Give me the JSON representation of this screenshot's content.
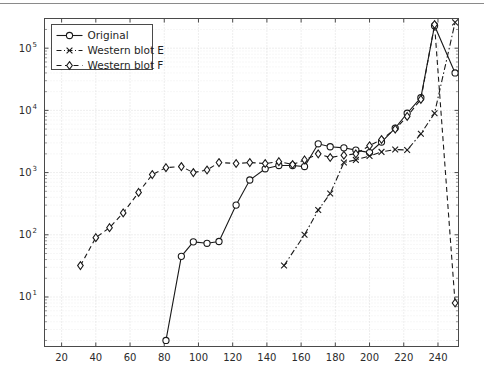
{
  "figure": {
    "top_rule": true,
    "background": "#ffffff",
    "ink_color": "#1a1a1a",
    "grid_color": "#cfcfcf",
    "axis_color": "#4a4a4a"
  },
  "legend": {
    "position": "top-left",
    "entries": [
      {
        "label": "Original",
        "marker": "circle",
        "linestyle": "solid"
      },
      {
        "label": "Western blot E",
        "marker": "x",
        "linestyle": "dashdot"
      },
      {
        "label": "Western blot F",
        "marker": "diamond",
        "linestyle": "dashed"
      }
    ]
  },
  "chart_data": {
    "type": "line",
    "title": "",
    "xlabel": "",
    "ylabel": "",
    "yscale": "log",
    "xscale": "linear",
    "xlim": [
      10,
      252
    ],
    "ylim": [
      1.6,
      300000
    ],
    "grid": true,
    "xticks": [
      20,
      40,
      60,
      80,
      100,
      120,
      140,
      160,
      180,
      200,
      220,
      240
    ],
    "xticklabels": [
      "20",
      "40",
      "60",
      "80",
      "100",
      "120",
      "140",
      "160",
      "180",
      "200",
      "220",
      "240"
    ],
    "yticks": [
      10,
      100,
      1000,
      10000,
      100000
    ],
    "yticklabels": [
      "10^1",
      "10^2",
      "10^3",
      "10^4",
      "10^5"
    ],
    "legend_position": "upper left",
    "series": [
      {
        "name": "Original",
        "marker": "circle",
        "linestyle": "solid",
        "x": [
          81,
          90,
          97,
          105,
          112,
          122,
          130,
          139,
          147,
          155,
          162,
          170,
          177,
          185,
          192,
          200,
          207,
          215,
          222,
          230,
          238,
          250
        ],
        "y": [
          2.0,
          45,
          77,
          73,
          78,
          300,
          760,
          1150,
          1300,
          1300,
          1250,
          2900,
          2600,
          2500,
          2300,
          2100,
          3100,
          5200,
          9000,
          16000,
          230000,
          40000
        ]
      },
      {
        "name": "Western blot E",
        "marker": "x",
        "linestyle": "dashdot",
        "x": [
          150,
          162,
          170,
          177,
          185,
          192,
          200,
          207,
          215,
          222,
          230,
          238,
          250
        ],
        "y": [
          32,
          100,
          250,
          460,
          1450,
          1600,
          1850,
          2150,
          2350,
          2300,
          4200,
          9000,
          260000
        ]
      },
      {
        "name": "Western blot F",
        "marker": "diamond",
        "linestyle": "dashed",
        "x": [
          31,
          40,
          48,
          56,
          65,
          73,
          81,
          90,
          97,
          105,
          112,
          122,
          130,
          139,
          147,
          155,
          162,
          170,
          177,
          185,
          192,
          200,
          207,
          215,
          222,
          230,
          238,
          250
        ],
        "y": [
          32,
          90,
          130,
          225,
          480,
          930,
          1200,
          1250,
          1000,
          1100,
          1450,
          1400,
          1450,
          1400,
          1500,
          1350,
          1600,
          2000,
          1750,
          1900,
          2000,
          2700,
          3400,
          5000,
          8000,
          15000,
          240000,
          8
        ]
      }
    ]
  }
}
